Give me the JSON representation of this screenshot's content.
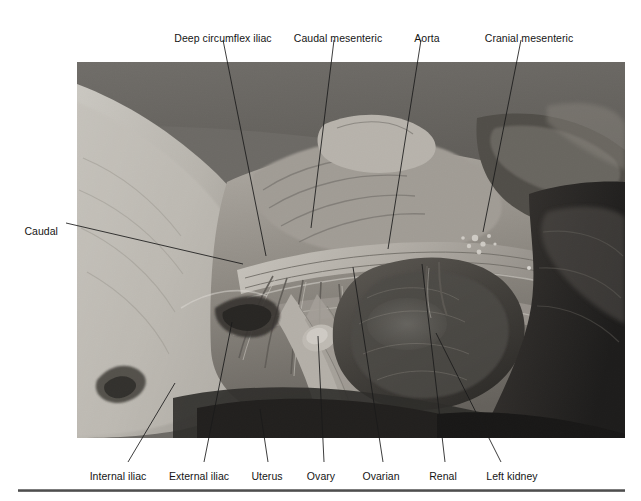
{
  "figure": {
    "kind": "anatomy-photograph-figure",
    "background_color": "#ffffff",
    "text_color": "#151515",
    "rule_color": "#4a4a4a",
    "photo": {
      "x": 77,
      "y": 62,
      "width": 548,
      "height": 376,
      "description": "Black and white dissection photograph of the abdominal aorta and its branches in a female animal specimen, with left kidney, uterus and ovary exposed.",
      "tone_light": "#d9d7d2",
      "tone_mid": "#8e8b86",
      "tone_dark": "#2a2a2a",
      "tone_black": "#101010"
    }
  },
  "labels": {
    "top": [
      {
        "name": "deep-circumflex-iliac",
        "text": "Deep circumflex iliac",
        "text_x": 223,
        "text_y": 32,
        "align": "center",
        "leader": {
          "x1": 223,
          "y1": 40,
          "x2": 266,
          "y2": 256
        }
      },
      {
        "name": "caudal-mesenteric",
        "text": "Caudal mesenteric",
        "text_x": 338,
        "text_y": 32,
        "align": "center",
        "leader": {
          "x1": 334,
          "y1": 40,
          "x2": 311,
          "y2": 228
        }
      },
      {
        "name": "aorta",
        "text": "Aorta",
        "text_x": 427,
        "text_y": 32,
        "align": "center",
        "leader": {
          "x1": 421,
          "y1": 40,
          "x2": 388,
          "y2": 249
        }
      },
      {
        "name": "cranial-mesenteric",
        "text": "Cranial mesenteric",
        "text_x": 529,
        "text_y": 32,
        "align": "center",
        "leader": {
          "x1": 521,
          "y1": 40,
          "x2": 483,
          "y2": 232
        }
      }
    ],
    "left": [
      {
        "name": "caudal",
        "text": "Caudal",
        "text_x": 58,
        "text_y": 225,
        "align": "right",
        "leader": {
          "x1": 66,
          "y1": 223,
          "x2": 243,
          "y2": 264
        }
      }
    ],
    "bottom": [
      {
        "name": "internal-iliac",
        "text": "Internal iliac",
        "text_x": 118,
        "text_y": 470,
        "align": "center",
        "leader": {
          "x1": 128,
          "y1": 462,
          "x2": 175,
          "y2": 383
        }
      },
      {
        "name": "external-iliac",
        "text": "External iliac",
        "text_x": 199,
        "text_y": 470,
        "align": "center",
        "leader": {
          "x1": 204,
          "y1": 462,
          "x2": 232,
          "y2": 322
        }
      },
      {
        "name": "uterus",
        "text": "Uterus",
        "text_x": 267,
        "text_y": 470,
        "align": "center",
        "leader": {
          "x1": 268,
          "y1": 462,
          "x2": 260,
          "y2": 409
        }
      },
      {
        "name": "ovary",
        "text": "Ovary",
        "text_x": 321,
        "text_y": 470,
        "align": "center",
        "leader": {
          "x1": 324,
          "y1": 462,
          "x2": 318,
          "y2": 336
        }
      },
      {
        "name": "ovarian",
        "text": "Ovarian",
        "text_x": 381,
        "text_y": 470,
        "align": "center",
        "leader": {
          "x1": 383,
          "y1": 462,
          "x2": 353,
          "y2": 267
        }
      },
      {
        "name": "renal",
        "text": "Renal",
        "text_x": 443,
        "text_y": 470,
        "align": "center",
        "leader": {
          "x1": 445,
          "y1": 462,
          "x2": 422,
          "y2": 264
        }
      },
      {
        "name": "left-kidney",
        "text": "Left kidney",
        "text_x": 512,
        "text_y": 470,
        "align": "center",
        "leader": {
          "x1": 501,
          "y1": 462,
          "x2": 436,
          "y2": 333
        }
      }
    ]
  },
  "rule": {
    "x": 18,
    "y": 489,
    "width": 607,
    "height": 3
  }
}
